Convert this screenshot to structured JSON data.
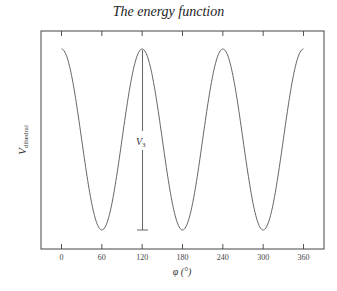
{
  "chart_data": {
    "type": "line",
    "title": "The energy function",
    "xlabel": "φ (°)",
    "ylabel": "V_dihedral",
    "ylabel_main": "V",
    "ylabel_sub": "dihedral",
    "xlim": [
      -15,
      390
    ],
    "x_ticks": [
      0,
      60,
      120,
      180,
      240,
      300,
      360
    ],
    "x_tick_labels": [
      "0",
      "60",
      "120",
      "180",
      "240",
      "300",
      "360"
    ],
    "y_ticks_unlabeled": true,
    "grid": false,
    "legend": null,
    "function": "V = (V3/2)(1 + cos(3φ))",
    "series": [
      {
        "name": "V_dihedral",
        "x": [
          0,
          30,
          60,
          90,
          120,
          150,
          180,
          210,
          240,
          270,
          300,
          330,
          360
        ],
        "y": [
          1,
          0.5,
          0,
          0.5,
          1,
          0.5,
          0,
          0.5,
          1,
          0.5,
          0,
          0.5,
          1
        ]
      }
    ],
    "annotations": [
      {
        "type": "vertical-bar",
        "x": 120,
        "y_from": 0,
        "y_to": 1,
        "label": "V",
        "label_sub": "3"
      }
    ]
  }
}
